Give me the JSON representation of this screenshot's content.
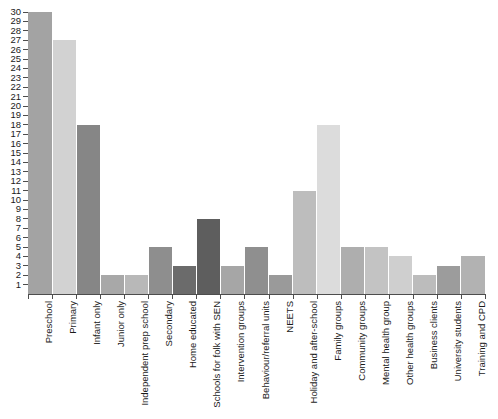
{
  "chart_data": {
    "type": "bar",
    "title": "",
    "subtitle": "",
    "xlabel": "",
    "ylabel": "",
    "ylim": [
      0,
      30
    ],
    "yticks": [
      1,
      2,
      3,
      4,
      5,
      6,
      7,
      8,
      9,
      10,
      11,
      12,
      13,
      14,
      15,
      16,
      17,
      18,
      19,
      20,
      21,
      22,
      23,
      24,
      25,
      26,
      27,
      28,
      29,
      30
    ],
    "grid": false,
    "legend": "none",
    "categories": [
      "Preschool",
      "Primary",
      "Infant only",
      "Junior only",
      "Independent prep school",
      "Secondary",
      "Home educated",
      "Schools for folk with SEN",
      "Intervention groups",
      "Behaviour/referral units",
      "NEETS",
      "Holiday and after-school",
      "Family groups",
      "Community groups",
      "Mental health group",
      "Other health groups",
      "Business clients",
      "University students",
      "Training and CPD"
    ],
    "values": [
      30,
      27,
      18,
      2,
      2,
      5,
      3,
      8,
      3,
      5,
      2,
      11,
      18,
      5,
      5,
      4,
      2,
      3,
      4
    ],
    "bar_colors": [
      "#a3a3a3",
      "#d2d2d2",
      "#868686",
      "#a8a8a8",
      "#b8b8b8",
      "#8e8e8e",
      "#6b6b6b",
      "#5e5e5e",
      "#a6a6a6",
      "#8f8f8f",
      "#9a9a9a",
      "#bdbdbd",
      "#dcdcdc",
      "#aeaeae",
      "#c3c3c3",
      "#cfcfcf",
      "#bcbcbc",
      "#9c9c9c",
      "#b2b2b2"
    ],
    "axis_color": "#4d4d4d",
    "text_color": "#1a1a1a",
    "background": "#ffffff"
  }
}
